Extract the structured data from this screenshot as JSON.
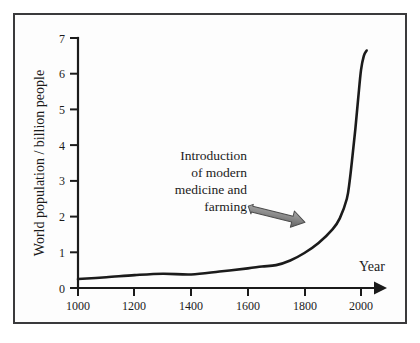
{
  "figure": {
    "background_color": "#fdfdfd",
    "frame_color": "#3a3a3c",
    "ink_color": "#1b1b1b",
    "arrow_fill": "#8c8c8c",
    "arrow_stroke": "#4d4d4d"
  },
  "chart_data": {
    "type": "line",
    "title": "",
    "xlabel": "Year",
    "ylabel": "World population / billion people",
    "xlim": [
      1000,
      2050
    ],
    "ylim": [
      0,
      7
    ],
    "xticks": [
      1000,
      1200,
      1400,
      1600,
      1800,
      2000
    ],
    "xticklabels": [
      "1000",
      "1200",
      "1400",
      "1600",
      "1800",
      "2000"
    ],
    "yticks": [
      0,
      1,
      2,
      3,
      4,
      5,
      6,
      7
    ],
    "yticklabels": [
      "0",
      "1",
      "2",
      "3",
      "4",
      "5",
      "6",
      "7"
    ],
    "grid": false,
    "legend": null,
    "series": [
      {
        "name": "World population",
        "x": [
          1000,
          1100,
          1200,
          1300,
          1400,
          1500,
          1600,
          1650,
          1700,
          1750,
          1800,
          1850,
          1900,
          1925,
          1950,
          1960,
          1970,
          1980,
          1990,
          2000,
          2010,
          2020
        ],
        "y": [
          0.25,
          0.3,
          0.36,
          0.4,
          0.38,
          0.46,
          0.55,
          0.6,
          0.64,
          0.77,
          0.98,
          1.26,
          1.65,
          1.95,
          2.5,
          3.0,
          3.7,
          4.45,
          5.3,
          6.1,
          6.5,
          6.65
        ]
      }
    ],
    "annotations": [
      {
        "name": "introduction-annotation",
        "lines": [
          "Introduction",
          "of modern",
          "medicine and",
          "farming"
        ],
        "arrow": {
          "from_x": 1650,
          "from_y": 2.25,
          "to_x": 1880,
          "to_y": 1.72,
          "style": "block-arrow-3d"
        }
      }
    ]
  }
}
